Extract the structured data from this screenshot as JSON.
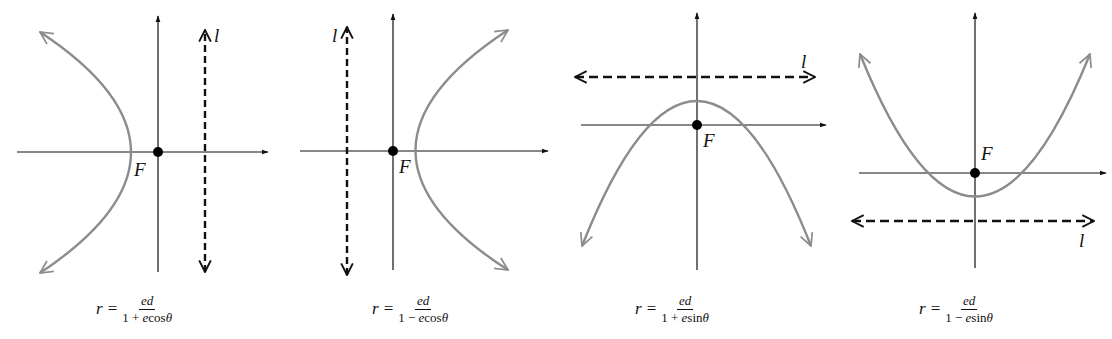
{
  "figure": {
    "colors": {
      "axis": "#111111",
      "curve": "#8c8c8c",
      "directrix": "#111111",
      "focus": "#000000",
      "background": "#ffffff"
    },
    "panels": [
      {
        "id": "panel-1",
        "focus_label": "F",
        "directrix_label": "l",
        "directrix_orientation": "vertical",
        "directrix_side": "right",
        "opens": "left",
        "formula": {
          "lhs": "r",
          "eq": "=",
          "num": "ed",
          "den_pre": "1 + ",
          "den_var": "e",
          "den_fn": "cos",
          "den_angle": "θ"
        }
      },
      {
        "id": "panel-2",
        "focus_label": "F",
        "directrix_label": "l",
        "directrix_orientation": "vertical",
        "directrix_side": "left",
        "opens": "right",
        "formula": {
          "lhs": "r",
          "eq": "=",
          "num": "ed",
          "den_pre": "1 − ",
          "den_var": "e",
          "den_fn": "cos",
          "den_angle": "θ"
        }
      },
      {
        "id": "panel-3",
        "focus_label": "F",
        "directrix_label": "l",
        "directrix_orientation": "horizontal",
        "directrix_side": "above",
        "opens": "down",
        "formula": {
          "lhs": "r",
          "eq": "=",
          "num": "ed",
          "den_pre": "1 + ",
          "den_var": "e",
          "den_fn": "sin",
          "den_angle": "θ"
        }
      },
      {
        "id": "panel-4",
        "focus_label": "F",
        "directrix_label": "l",
        "directrix_orientation": "horizontal",
        "directrix_side": "below",
        "opens": "up",
        "formula": {
          "lhs": "r",
          "eq": "=",
          "num": "ed",
          "den_pre": "1 − ",
          "den_var": "e",
          "den_fn": "sin",
          "den_angle": "θ"
        }
      }
    ]
  }
}
